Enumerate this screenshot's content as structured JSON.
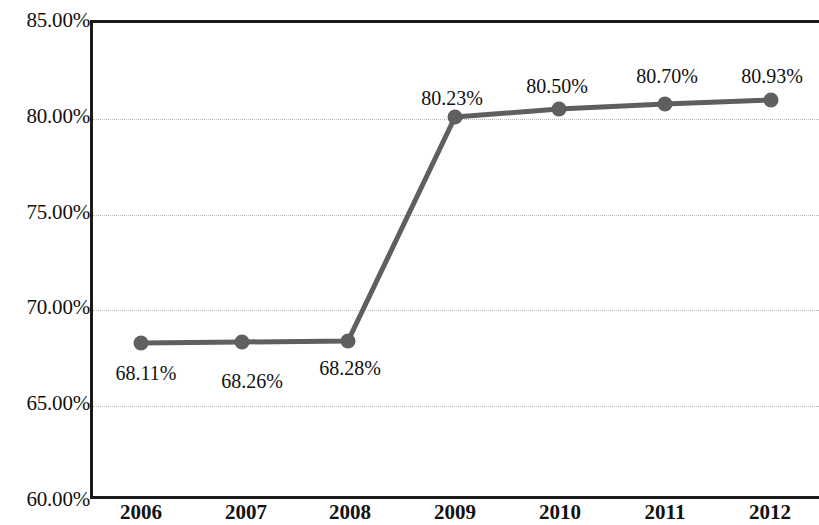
{
  "chart_data": {
    "type": "line",
    "title": "",
    "subtitle": "",
    "xlabel": "",
    "ylabel": "",
    "categories": [
      "2006",
      "2007",
      "2008",
      "2009",
      "2010",
      "2011",
      "2012"
    ],
    "values": [
      68.11,
      68.26,
      68.28,
      80.23,
      80.5,
      80.7,
      80.93
    ],
    "data_labels": [
      "68.11%",
      "68.26%",
      "68.28%",
      "80.23%",
      "80.50%",
      "80.70%",
      "80.93%"
    ],
    "ylim": [
      60.0,
      85.0
    ],
    "ytick_values": [
      85.0,
      80.0,
      75.0,
      70.0,
      65.0,
      60.0
    ],
    "ytick_labels": [
      "85.00%",
      "80.00%",
      "75.00%",
      "70.00%",
      "65.00%",
      "60.00%"
    ],
    "grid": true,
    "grid_style": "dotted",
    "legend": false,
    "legend_position": "none",
    "series": [
      {
        "name": "",
        "values": [
          68.11,
          68.26,
          68.28,
          80.23,
          80.5,
          80.7,
          80.93
        ],
        "color": "#5f5f5f",
        "marker": "circle"
      }
    ],
    "colors": {
      "line": "#5f5f5f",
      "marker": "#5f5f5f",
      "axis": "#1a1a1a",
      "grid": "#b9b9b9",
      "text": "#111111",
      "background": "#ffffff"
    }
  },
  "axis": {
    "y_ticks": [
      {
        "label": "85.00%",
        "value": 85.0
      },
      {
        "label": "80.00%",
        "value": 80.0
      },
      {
        "label": "75.00%",
        "value": 75.0
      },
      {
        "label": "70.00%",
        "value": 70.0
      },
      {
        "label": "65.00%",
        "value": 65.0
      },
      {
        "label": "60.00%",
        "value": 60.0
      }
    ],
    "x_ticks": [
      {
        "label": "2006"
      },
      {
        "label": "2007"
      },
      {
        "label": "2008"
      },
      {
        "label": "2009"
      },
      {
        "label": "2010"
      },
      {
        "label": "2011"
      },
      {
        "label": "2012"
      }
    ]
  },
  "points": [
    {
      "label": "68.11%",
      "x_label": "2006",
      "value": 68.11,
      "px": 141,
      "py": 343,
      "lx": 146,
      "ly": 363
    },
    {
      "label": "68.26%",
      "x_label": "2007",
      "value": 68.26,
      "px": 242,
      "py": 342,
      "lx": 252,
      "ly": 371
    },
    {
      "label": "68.28%",
      "x_label": "2008",
      "value": 68.28,
      "px": 348,
      "py": 341,
      "lx": 350,
      "ly": 358
    },
    {
      "label": "80.23%",
      "x_label": "2009",
      "value": 80.23,
      "px": 455,
      "py": 117,
      "lx": 452,
      "ly": 88
    },
    {
      "label": "80.50%",
      "x_label": "2010",
      "value": 80.5,
      "px": 559,
      "py": 109,
      "lx": 557,
      "ly": 76
    },
    {
      "label": "80.70%",
      "x_label": "2011",
      "value": 80.7,
      "px": 665,
      "py": 104,
      "lx": 667,
      "ly": 66
    },
    {
      "label": "80.93%",
      "x_label": "2012",
      "value": 80.93,
      "px": 771,
      "py": 100,
      "lx": 772,
      "ly": 66
    }
  ]
}
